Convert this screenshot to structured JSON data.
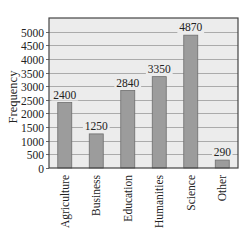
{
  "chart_data": {
    "type": "bar",
    "title": "",
    "xlabel": "",
    "ylabel": "Frequency",
    "categories": [
      "Agriculture",
      "Business",
      "Education",
      "Humanities",
      "Science",
      "Other"
    ],
    "values": [
      2400,
      1250,
      2840,
      3350,
      4870,
      290
    ],
    "data_labels": [
      "2400",
      "1250",
      "2840",
      "3350",
      "4870",
      "290"
    ],
    "ylim": [
      0,
      5500
    ],
    "yticks": [
      0,
      500,
      1000,
      1500,
      2000,
      2500,
      3000,
      3500,
      4000,
      4500,
      5000
    ],
    "grid": true,
    "legend": "none",
    "colors": {
      "bar_fill": "#9c9c9c",
      "bar_stroke": "#6e6e6e",
      "plot_background": "#ececec",
      "gridline": "#9a9a9a",
      "frame": "#444444"
    }
  }
}
